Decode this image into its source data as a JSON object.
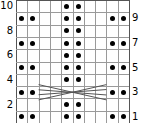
{
  "chart_data": {
    "type": "heatmap",
    "title": "",
    "xlabel": "",
    "ylabel": "",
    "columns": 10,
    "rows": 10,
    "left_tick_labels": [
      "10",
      "8",
      "6",
      "4",
      "2"
    ],
    "right_tick_labels": [
      "9",
      "7",
      "5",
      "3",
      "1"
    ],
    "left_tick_rows": [
      10,
      8,
      6,
      4,
      2
    ],
    "right_tick_rows": [
      9,
      7,
      5,
      3,
      1
    ],
    "grid": true,
    "legend": "none",
    "symbol": "purl-dot",
    "colors": {
      "dot": "#000000",
      "gridline": "#9a9a9a",
      "border": "#555555",
      "background": "#ffffff",
      "cable": "#555555"
    },
    "rows_data": [
      {
        "row": 10,
        "dot_columns": [
          5,
          6
        ]
      },
      {
        "row": 9,
        "dot_columns": [
          1,
          2,
          5,
          6,
          9,
          10
        ]
      },
      {
        "row": 8,
        "dot_columns": [
          5,
          6
        ]
      },
      {
        "row": 7,
        "dot_columns": [
          1,
          2,
          5,
          6,
          9,
          10
        ]
      },
      {
        "row": 6,
        "dot_columns": [
          5,
          6
        ]
      },
      {
        "row": 5,
        "dot_columns": [
          1,
          2,
          5,
          6,
          9,
          10
        ]
      },
      {
        "row": 4,
        "dot_columns": [
          5,
          6
        ]
      },
      {
        "row": 3,
        "dot_columns": [
          1,
          2,
          9,
          10
        ]
      },
      {
        "row": 2,
        "dot_columns": [
          5,
          6
        ]
      },
      {
        "row": 1,
        "dot_columns": [
          1,
          2,
          5,
          6,
          9,
          10
        ]
      }
    ],
    "annotations": [
      {
        "name": "cable-cross",
        "type": "x-cross",
        "row": 3,
        "column_span": [
          3,
          8
        ],
        "description": "cable cross lines spanning columns 3 through 8 at row 3"
      }
    ]
  }
}
